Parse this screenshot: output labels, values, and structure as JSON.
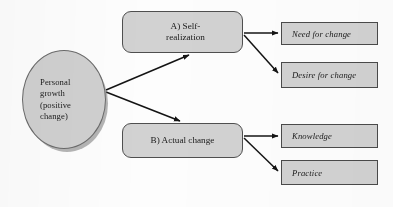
{
  "diagram": {
    "colors": {
      "node_fill": "#d2d2d2",
      "node_border": "#4f4f4f",
      "arrow": "#141414",
      "background": "#fdfdfd",
      "text": "#1a1a1a"
    },
    "source": {
      "id": "personal-growth",
      "shape": "ellipse",
      "label": "Personal\ngrowth\n(positive\nchange)"
    },
    "stages": [
      {
        "id": "stage-a",
        "shape": "rounded-rectangle",
        "marker": "A)",
        "label": "A)  Self-\nrealization"
      },
      {
        "id": "stage-b",
        "shape": "rounded-rectangle",
        "marker": "B)",
        "label": "B) Actual change"
      }
    ],
    "outcomes": [
      {
        "id": "outcome-need",
        "parent": "stage-a",
        "label": "Need for change"
      },
      {
        "id": "outcome-desire",
        "parent": "stage-a",
        "label": "Desire for change"
      },
      {
        "id": "outcome-knowledge",
        "parent": "stage-b",
        "label": "Knowledge"
      },
      {
        "id": "outcome-practice",
        "parent": "stage-b",
        "label": "Practice"
      }
    ],
    "connectors": [
      {
        "id": "arrow-source-to-stage-a",
        "from": "personal-growth",
        "to": "stage-a",
        "direction": "up-right"
      },
      {
        "id": "arrow-source-to-stage-b",
        "from": "personal-growth",
        "to": "stage-b",
        "direction": "down-right"
      },
      {
        "id": "arrow-stage-a-to-need",
        "from": "stage-a",
        "to": "outcome-need",
        "direction": "right"
      },
      {
        "id": "arrow-stage-a-to-desire",
        "from": "stage-a",
        "to": "outcome-desire",
        "direction": "down-right"
      },
      {
        "id": "arrow-stage-b-to-knowledge",
        "from": "stage-b",
        "to": "outcome-knowledge",
        "direction": "right"
      },
      {
        "id": "arrow-stage-b-to-practice",
        "from": "stage-b",
        "to": "outcome-practice",
        "direction": "down-right"
      }
    ]
  }
}
